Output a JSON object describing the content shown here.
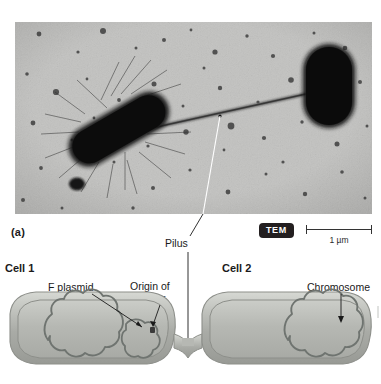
{
  "figure": {
    "panel_a_label": "(a)",
    "micrograph": {
      "technique_badge": "TEM",
      "scale_bar_label": "1 µm",
      "subject": "bacterial-conjugation-electron-micrograph"
    },
    "callouts": {
      "pilus": "Pilus"
    },
    "diagram": {
      "cell1_label": "Cell 1",
      "cell2_label": "Cell 2",
      "f_plasmid_label": "F plasmid",
      "origin_of_transfer_label": "Origin of\ntransfer",
      "origin_of_transfer_line1": "Origin of",
      "origin_of_transfer_line2": "transfer",
      "chromosome_label": "Chromosome"
    }
  },
  "colors": {
    "badge_bg": "#231f20",
    "badge_text": "#ffffff",
    "micrograph_bg": "#b9b9b7",
    "cell_fill": "#b7b9b4",
    "cell_wall": "#9a9c97",
    "dna_stroke": "#6f7470",
    "text": "#1a1a1a",
    "leader": "#1a1a1a"
  }
}
